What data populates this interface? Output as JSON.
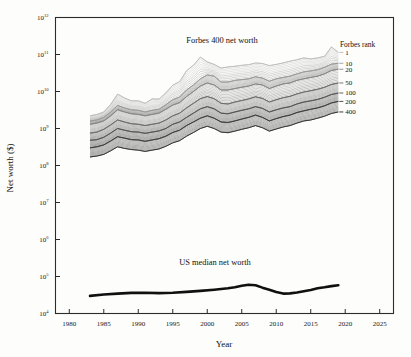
{
  "figure": {
    "background": "#fdfdfb",
    "ink": "#1a1a1a"
  },
  "axes": {
    "x_title": "Year",
    "y_title": "Net worth ($)",
    "x_ticks": [
      "1980",
      "1985",
      "1990",
      "1995",
      "2000",
      "2005",
      "2010",
      "2015",
      "2020",
      "2025"
    ],
    "y_tick_exponents": [
      "12",
      "11",
      "10",
      "9",
      "8",
      "7",
      "6",
      "5",
      "4"
    ],
    "y_tick_mantissa": "10"
  },
  "annotations": {
    "forbes_label": "Forbes 400 net worth",
    "median_label": "US median net worth"
  },
  "legend": {
    "title": "Forbes rank",
    "items": [
      {
        "label": "1",
        "rank": 1,
        "color": "#b9b9b9"
      },
      {
        "label": "10",
        "rank": 10,
        "color": "#9a9a9a"
      },
      {
        "label": "20",
        "rank": 20,
        "color": "#868686"
      },
      {
        "label": "50",
        "rank": 50,
        "color": "#6a6a6a"
      },
      {
        "label": "100",
        "rank": 100,
        "color": "#525252"
      },
      {
        "label": "200",
        "rank": 200,
        "color": "#3b3b3b"
      },
      {
        "label": "400",
        "rank": 400,
        "color": "#262626"
      }
    ]
  },
  "chart_data": {
    "type": "line",
    "title": "Forbes 400 net worth",
    "xlabel": "Year",
    "ylabel": "Net worth ($)",
    "xlim": [
      1978,
      2027
    ],
    "ylim": [
      10000,
      1000000000000
    ],
    "yscale": "log",
    "grid": false,
    "legend_position": "right",
    "x": [
      1983,
      1984,
      1985,
      1986,
      1987,
      1988,
      1989,
      1990,
      1991,
      1992,
      1993,
      1994,
      1995,
      1996,
      1997,
      1998,
      1999,
      2000,
      2001,
      2002,
      2003,
      2004,
      2005,
      2006,
      2007,
      2008,
      2009,
      2010,
      2011,
      2012,
      2013,
      2014,
      2015,
      2016,
      2017,
      2018,
      2019
    ],
    "series": [
      {
        "name": "Forbes rank 1",
        "rank": 1,
        "color": "#b9b9b9",
        "values": [
          2200000000.0,
          2400000000.0,
          2800000000.0,
          4500000000.0,
          8500000000.0,
          6700000000.0,
          5600000000.0,
          5600000000.0,
          4800000000.0,
          6300000000.0,
          6200000000.0,
          9200000000.0,
          14800000000.0,
          18500000000.0,
          36400000000.0,
          51000000000.0,
          85000000000.0,
          63000000000.0,
          54000000000.0,
          43000000000.0,
          46000000000.0,
          48000000000.0,
          51000000000.0,
          53000000000.0,
          59000000000.0,
          57000000000.0,
          50000000000.0,
          54000000000.0,
          59000000000.0,
          66000000000.0,
          72000000000.0,
          81000000000.0,
          76000000000.0,
          81000000000.0,
          89000000000.0,
          160000000000.0,
          114000000000.0
        ]
      },
      {
        "name": "Forbes rank 10",
        "rank": 10,
        "color": "#9a9a9a",
        "values": [
          1600000000.0,
          1700000000.0,
          2000000000.0,
          2800000000.0,
          4200000000.0,
          3600000000.0,
          3200000000.0,
          3100000000.0,
          2800000000.0,
          3100000000.0,
          3300000000.0,
          4400000000.0,
          6000000000.0,
          7100000000.0,
          11000000000.0,
          15000000000.0,
          22000000000.0,
          28000000000.0,
          26000000000.0,
          18000000000.0,
          18000000000.0,
          20000000000.0,
          21000000000.0,
          22000000000.0,
          25000000000.0,
          23000000000.0,
          19000000000.0,
          22000000000.0,
          24000000000.0,
          26000000000.0,
          30000000000.0,
          34000000000.0,
          36000000000.0,
          39000000000.0,
          45000000000.0,
          55000000000.0,
          58000000000.0
        ]
      },
      {
        "name": "Forbes rank 20",
        "rank": 20,
        "color": "#868686",
        "values": [
          1300000000.0,
          1400000000.0,
          1600000000.0,
          2200000000.0,
          3200000000.0,
          2800000000.0,
          2500000000.0,
          2400000000.0,
          2200000000.0,
          2400000000.0,
          2600000000.0,
          3300000000.0,
          4300000000.0,
          5000000000.0,
          7300000000.0,
          10000000000.0,
          14000000000.0,
          17000000000.0,
          15000000000.0,
          11000000000.0,
          11000000000.0,
          12000000000.0,
          13000000000.0,
          14000000000.0,
          16000000000.0,
          15000000000.0,
          12000000000.0,
          14000000000.0,
          16000000000.0,
          17000000000.0,
          20000000000.0,
          22000000000.0,
          24000000000.0,
          26000000000.0,
          30000000000.0,
          37000000000.0,
          40000000000.0
        ]
      },
      {
        "name": "Forbes rank 50",
        "rank": 50,
        "color": "#6a6a6a",
        "values": [
          750000000.0,
          800000000.0,
          950000000.0,
          1250000000.0,
          1700000000.0,
          1500000000.0,
          1350000000.0,
          1300000000.0,
          1200000000.0,
          1300000000.0,
          1400000000.0,
          1700000000.0,
          2200000000.0,
          2600000000.0,
          3600000000.0,
          4800000000.0,
          6400000000.0,
          7300000000.0,
          6400000000.0,
          4800000000.0,
          4600000000.0,
          5200000000.0,
          5700000000.0,
          6300000000.0,
          7200000000.0,
          6500000000.0,
          5200000000.0,
          6000000000.0,
          6800000000.0,
          7400000000.0,
          8600000000.0,
          9700000000.0,
          10500000000.0,
          11500000000.0,
          13000000000.0,
          15500000000.0,
          17000000000.0
        ]
      },
      {
        "name": "Forbes rank 100",
        "rank": 100,
        "color": "#525252",
        "values": [
          480000000.0,
          500000000.0,
          580000000.0,
          750000000.0,
          1000000000.0,
          900000000.0,
          820000000.0,
          800000000.0,
          740000000.0,
          800000000.0,
          860000000.0,
          1000000000.0,
          1300000000.0,
          1500000000.0,
          2000000000.0,
          2600000000.0,
          3400000000.0,
          3900000000.0,
          3400000000.0,
          2600000000.0,
          2500000000.0,
          2800000000.0,
          3100000000.0,
          3400000000.0,
          3900000000.0,
          3500000000.0,
          2800000000.0,
          3200000000.0,
          3600000000.0,
          3900000000.0,
          4600000000.0,
          5200000000.0,
          5600000000.0,
          6100000000.0,
          7000000000.0,
          8300000000.0,
          9100000000.0
        ]
      },
      {
        "name": "Forbes rank 200",
        "rank": 200,
        "color": "#3b3b3b",
        "values": [
          300000000.0,
          320000000.0,
          360000000.0,
          460000000.0,
          600000000.0,
          550000000.0,
          500000000.0,
          490000000.0,
          450000000.0,
          490000000.0,
          530000000.0,
          620000000.0,
          780000000.0,
          900000000.0,
          1200000000.0,
          1500000000.0,
          1900000000.0,
          2200000000.0,
          1900000000.0,
          1500000000.0,
          1450000000.0,
          1600000000.0,
          1800000000.0,
          2000000000.0,
          2300000000.0,
          2000000000.0,
          1600000000.0,
          1850000000.0,
          2100000000.0,
          2300000000.0,
          2700000000.0,
          3000000000.0,
          3300000000.0,
          3600000000.0,
          4100000000.0,
          4900000000.0,
          5400000000.0
        ]
      },
      {
        "name": "Forbes rank 400",
        "rank": 400,
        "color": "#262626",
        "values": [
          170000000.0,
          180000000.0,
          200000000.0,
          250000000.0,
          320000000.0,
          290000000.0,
          270000000.0,
          260000000.0,
          240000000.0,
          260000000.0,
          280000000.0,
          330000000.0,
          410000000.0,
          470000000.0,
          620000000.0,
          780000000.0,
          1000000000.0,
          1150000000.0,
          1000000000.0,
          800000000.0,
          770000000.0,
          850000000.0,
          950000000.0,
          1050000000.0,
          1200000000.0,
          1050000000.0,
          850000000.0,
          970000000.0,
          1100000000.0,
          1200000000.0,
          1400000000.0,
          1600000000.0,
          1700000000.0,
          1900000000.0,
          2150000000.0,
          2550000000.0,
          2800000000.0
        ]
      }
    ],
    "median_series": {
      "name": "US median net worth",
      "color": "#101010",
      "x": [
        1983,
        1985,
        1987,
        1989,
        1991,
        1993,
        1995,
        1997,
        1999,
        2001,
        2003,
        2004,
        2005,
        2006,
        2007,
        2008,
        2009,
        2010,
        2011,
        2012,
        2013,
        2014,
        2015,
        2016,
        2017,
        2018,
        2019
      ],
      "values": [
        30000,
        32500,
        34500,
        36000,
        36500,
        35500,
        36500,
        38500,
        41000,
        44000,
        48000,
        51000,
        56000,
        60000,
        58000,
        50000,
        44000,
        38000,
        34500,
        35000,
        37000,
        40000,
        43000,
        48000,
        51000,
        55000,
        58000
      ]
    }
  }
}
